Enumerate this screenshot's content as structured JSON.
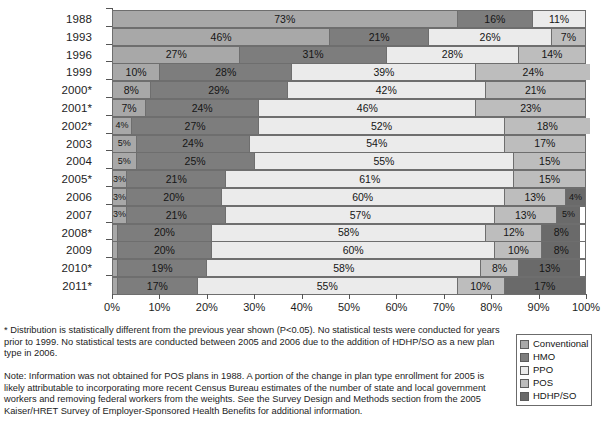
{
  "chart_data": {
    "type": "bar",
    "orientation": "horizontal",
    "stacked": true,
    "title": "",
    "xlabel": "",
    "ylabel": "",
    "xlim": [
      0,
      100
    ],
    "grid": false,
    "legend_position": "bottom-right",
    "unit": "%",
    "categories": [
      "1988",
      "1993",
      "1996",
      "1999",
      "2000*",
      "2001*",
      "2002*",
      "2003",
      "2004",
      "2005*",
      "2006",
      "2007",
      "2008*",
      "2009",
      "2010*",
      "2011*"
    ],
    "series": [
      {
        "name": "Conventional",
        "color": "#a8a8a8",
        "values": [
          73,
          46,
          27,
          10,
          8,
          7,
          4,
          5,
          5,
          3,
          3,
          3,
          1,
          1,
          1,
          1
        ]
      },
      {
        "name": "HMO",
        "color": "#7d7d7d",
        "values": [
          16,
          21,
          31,
          28,
          29,
          24,
          27,
          24,
          25,
          21,
          20,
          21,
          20,
          20,
          19,
          17
        ]
      },
      {
        "name": "PPO",
        "color": "#ebebeb",
        "values": [
          11,
          26,
          28,
          39,
          42,
          46,
          52,
          54,
          55,
          61,
          60,
          57,
          58,
          60,
          58,
          55
        ]
      },
      {
        "name": "POS",
        "color": "#bdbdbd",
        "values": [
          null,
          7,
          14,
          24,
          21,
          23,
          18,
          17,
          15,
          15,
          13,
          13,
          12,
          10,
          8,
          10
        ]
      },
      {
        "name": "HDHP/SO",
        "color": "#6a6a6a",
        "values": [
          null,
          null,
          null,
          null,
          null,
          null,
          null,
          null,
          null,
          null,
          4,
          5,
          8,
          8,
          13,
          17
        ]
      }
    ],
    "xticks": [
      "0%",
      "10%",
      "20%",
      "30%",
      "40%",
      "50%",
      "60%",
      "70%",
      "80%",
      "90%",
      "100%"
    ],
    "xtick_values": [
      0,
      10,
      20,
      30,
      40,
      50,
      60,
      70,
      80,
      90,
      100
    ],
    "rows": [
      {
        "year": "1988",
        "segments": [
          {
            "series": "Conventional",
            "value": 73,
            "label": "73%"
          },
          {
            "series": "HMO",
            "value": 16,
            "label": "16%"
          },
          {
            "series": "PPO",
            "value": 11,
            "label": "11%"
          }
        ]
      },
      {
        "year": "1993",
        "segments": [
          {
            "series": "Conventional",
            "value": 46,
            "label": "46%"
          },
          {
            "series": "HMO",
            "value": 21,
            "label": "21%"
          },
          {
            "series": "PPO",
            "value": 26,
            "label": "26%"
          },
          {
            "series": "POS",
            "value": 7,
            "label": "7%"
          }
        ]
      },
      {
        "year": "1996",
        "segments": [
          {
            "series": "Conventional",
            "value": 27,
            "label": "27%"
          },
          {
            "series": "HMO",
            "value": 31,
            "label": "31%"
          },
          {
            "series": "PPO",
            "value": 28,
            "label": "28%"
          },
          {
            "series": "POS",
            "value": 14,
            "label": "14%"
          }
        ]
      },
      {
        "year": "1999",
        "segments": [
          {
            "series": "Conventional",
            "value": 10,
            "label": "10%"
          },
          {
            "series": "HMO",
            "value": 28,
            "label": "28%"
          },
          {
            "series": "PPO",
            "value": 39,
            "label": "39%"
          },
          {
            "series": "POS",
            "value": 24,
            "label": "24%"
          }
        ]
      },
      {
        "year": "2000*",
        "segments": [
          {
            "series": "Conventional",
            "value": 8,
            "label": "8%"
          },
          {
            "series": "HMO",
            "value": 29,
            "label": "29%"
          },
          {
            "series": "PPO",
            "value": 42,
            "label": "42%"
          },
          {
            "series": "POS",
            "value": 21,
            "label": "21%"
          }
        ]
      },
      {
        "year": "2001*",
        "segments": [
          {
            "series": "Conventional",
            "value": 7,
            "label": "7%"
          },
          {
            "series": "HMO",
            "value": 24,
            "label": "24%"
          },
          {
            "series": "PPO",
            "value": 46,
            "label": "46%"
          },
          {
            "series": "POS",
            "value": 23,
            "label": "23%"
          }
        ]
      },
      {
        "year": "2002*",
        "segments": [
          {
            "series": "Conventional",
            "value": 4,
            "label": "4%"
          },
          {
            "series": "HMO",
            "value": 27,
            "label": "27%"
          },
          {
            "series": "PPO",
            "value": 52,
            "label": "52%"
          },
          {
            "series": "POS",
            "value": 18,
            "label": "18%"
          }
        ]
      },
      {
        "year": "2003",
        "segments": [
          {
            "series": "Conventional",
            "value": 5,
            "label": "5%"
          },
          {
            "series": "HMO",
            "value": 24,
            "label": "24%"
          },
          {
            "series": "PPO",
            "value": 54,
            "label": "54%"
          },
          {
            "series": "POS",
            "value": 17,
            "label": "17%"
          }
        ]
      },
      {
        "year": "2004",
        "segments": [
          {
            "series": "Conventional",
            "value": 5,
            "label": "5%"
          },
          {
            "series": "HMO",
            "value": 25,
            "label": "25%"
          },
          {
            "series": "PPO",
            "value": 55,
            "label": "55%"
          },
          {
            "series": "POS",
            "value": 15,
            "label": "15%"
          }
        ]
      },
      {
        "year": "2005*",
        "segments": [
          {
            "series": "Conventional",
            "value": 3,
            "label": "3%"
          },
          {
            "series": "HMO",
            "value": 21,
            "label": "21%"
          },
          {
            "series": "PPO",
            "value": 61,
            "label": "61%"
          },
          {
            "series": "POS",
            "value": 15,
            "label": "15%"
          }
        ]
      },
      {
        "year": "2006",
        "segments": [
          {
            "series": "Conventional",
            "value": 3,
            "label": "3%"
          },
          {
            "series": "HMO",
            "value": 20,
            "label": "20%"
          },
          {
            "series": "PPO",
            "value": 60,
            "label": "60%"
          },
          {
            "series": "POS",
            "value": 13,
            "label": "13%"
          },
          {
            "series": "HDHP/SO",
            "value": 4,
            "label": "4%"
          }
        ]
      },
      {
        "year": "2007",
        "segments": [
          {
            "series": "Conventional",
            "value": 3,
            "label": "3%"
          },
          {
            "series": "HMO",
            "value": 21,
            "label": "21%"
          },
          {
            "series": "PPO",
            "value": 57,
            "label": "57%"
          },
          {
            "series": "POS",
            "value": 13,
            "label": "13%"
          },
          {
            "series": "HDHP/SO",
            "value": 5,
            "label": "5%"
          }
        ]
      },
      {
        "year": "2008*",
        "segments": [
          {
            "series": "Conventional",
            "value": 1,
            "label": "1%",
            "outside": true
          },
          {
            "series": "HMO",
            "value": 20,
            "label": "20%"
          },
          {
            "series": "PPO",
            "value": 58,
            "label": "58%"
          },
          {
            "series": "POS",
            "value": 12,
            "label": "12%"
          },
          {
            "series": "HDHP/SO",
            "value": 8,
            "label": "8%"
          }
        ]
      },
      {
        "year": "2009",
        "segments": [
          {
            "series": "Conventional",
            "value": 1,
            "label": "1%",
            "outside": true
          },
          {
            "series": "HMO",
            "value": 20,
            "label": "20%"
          },
          {
            "series": "PPO",
            "value": 60,
            "label": "60%"
          },
          {
            "series": "POS",
            "value": 10,
            "label": "10%"
          },
          {
            "series": "HDHP/SO",
            "value": 8,
            "label": "8%"
          }
        ]
      },
      {
        "year": "2010*",
        "segments": [
          {
            "series": "Conventional",
            "value": 1,
            "label": "1%",
            "outside": true
          },
          {
            "series": "HMO",
            "value": 19,
            "label": "19%"
          },
          {
            "series": "PPO",
            "value": 58,
            "label": "58%"
          },
          {
            "series": "POS",
            "value": 8,
            "label": "8%"
          },
          {
            "series": "HDHP/SO",
            "value": 13,
            "label": "13%"
          }
        ]
      },
      {
        "year": "2011*",
        "segments": [
          {
            "series": "Conventional",
            "value": 1,
            "label": "1%",
            "outside": true
          },
          {
            "series": "HMO",
            "value": 17,
            "label": "17%"
          },
          {
            "series": "PPO",
            "value": 55,
            "label": "55%"
          },
          {
            "series": "POS",
            "value": 10,
            "label": "10%"
          },
          {
            "series": "HDHP/SO",
            "value": 17,
            "label": "17%"
          }
        ]
      }
    ]
  },
  "legend": {
    "items": [
      {
        "label": "Conventional",
        "color": "#a8a8a8"
      },
      {
        "label": "HMO",
        "color": "#7d7d7d"
      },
      {
        "label": "PPO",
        "color": "#ebebeb"
      },
      {
        "label": "POS",
        "color": "#bdbdbd"
      },
      {
        "label": "HDHP/SO",
        "color": "#6a6a6a"
      }
    ]
  },
  "footnote": "* Distribution is statistically different from the previous year shown (P<0.05). No statistical tests were conducted for years prior to 1999. No statistical tests are conducted between 2005 and 2006 due to the addition of HDHP/SO as a new plan type in 2006.",
  "note": "Note: Information was not obtained for POS plans in 1988. A portion of the change in plan type enrollment for 2005 is likely attributable to incorporating more recent Census Bureau estimates of the number of state and local government workers and removing federal workers from the weights. See the Survey Design and Methods section from the 2005 Kaiser/HRET Survey of Employer-Sponsored Health Benefits for additional information."
}
